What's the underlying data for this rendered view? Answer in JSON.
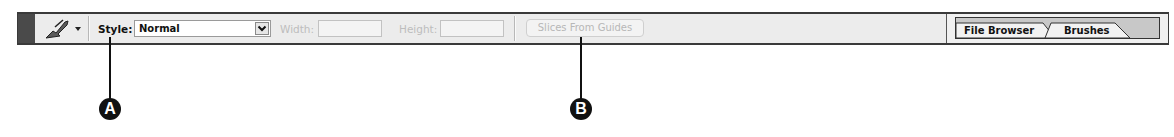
{
  "toolbar": {
    "tool": {
      "icon": "slice-select-tool-icon",
      "dropdown_icon": "triangle-down-icon"
    },
    "style": {
      "label": "Style:",
      "value": "Normal",
      "dropdown_icon": "chevron-down-icon"
    },
    "width": {
      "label": "Width:",
      "value": ""
    },
    "height": {
      "label": "Height:",
      "value": ""
    },
    "slices_from_guides_label": "Slices From Guides"
  },
  "palette_well": {
    "tabs": [
      {
        "label": "File Browser"
      },
      {
        "label": "Brushes"
      }
    ]
  },
  "callouts": [
    {
      "label": "A"
    },
    {
      "label": "B"
    }
  ],
  "colors": {
    "toolbar_bg": "#ececec",
    "frame": "#3a3a3a",
    "disabled_text": "#bdbdbd",
    "callout": "#111111"
  }
}
